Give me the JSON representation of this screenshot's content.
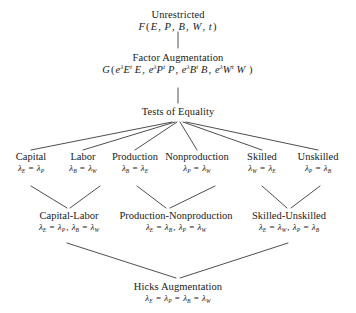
{
  "diagram": {
    "background_color": "#ffffff",
    "line_color": "#3a3a3a",
    "text_color": "#1a1a1a"
  },
  "root": {
    "label": "Unrestricted",
    "formula": "F(E, P, B, W, t)"
  },
  "factor_augmentation": {
    "label": "Factor Augmentation",
    "formula": "G(eλEᵗ E, eλPᵗ P, eλBᵗ B, eλWᵗ W )"
  },
  "tests": {
    "label": "Tests of Equality"
  },
  "categories": [
    {
      "label": "Capital",
      "condition": "λE = λP"
    },
    {
      "label": "Labor",
      "condition": "λB = λW"
    },
    {
      "label": "Production",
      "condition": "λB = λE"
    },
    {
      "label": "Nonproduction",
      "condition": "λP = λW"
    },
    {
      "label": "Skilled",
      "condition": "λW = λE"
    },
    {
      "label": "Unskilled",
      "condition": "λP = λB"
    }
  ],
  "pairs": [
    {
      "label": "Capital-Labor",
      "condition": "λE = λP, λB = λW"
    },
    {
      "label": "Production-Nonproduction",
      "condition": "λE = λB, λP = λW"
    },
    {
      "label": "Skilled-Unskilled",
      "condition": "λE = λW, λP = λB"
    }
  ],
  "hicks": {
    "label": "Hicks Augmentation",
    "condition": "λE = λP = λB = λW"
  }
}
